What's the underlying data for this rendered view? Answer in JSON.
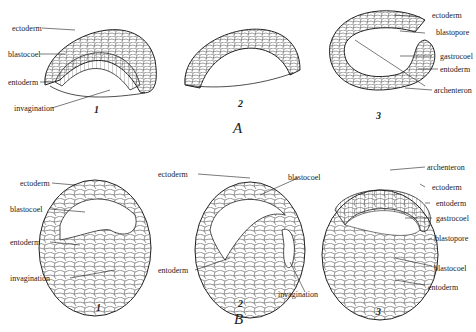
{
  "figure": {
    "groups": [
      {
        "letter": "A",
        "panels": [
          {
            "number": "1",
            "labels": [
              "ectoderm",
              "blastocoel",
              "entoderm",
              "invagination"
            ]
          },
          {
            "number": "2",
            "labels": []
          },
          {
            "number": "3",
            "labels": [
              "ectoderm",
              "blastopore",
              "gastrocoel",
              "entoderm",
              "archenteron"
            ]
          }
        ]
      },
      {
        "letter": "B",
        "panels": [
          {
            "number": "1",
            "labels": [
              "ectoderm",
              "blastocoel",
              "entoderm",
              "invagination"
            ]
          },
          {
            "number": "2",
            "labels": [
              "ectoderm",
              "blastocoel",
              "entoderm",
              "invagination"
            ]
          },
          {
            "number": "3",
            "labels": [
              "archenteron",
              "ectoderm",
              "entoderm",
              "gastrocoel",
              "blastopore",
              "blastocoel",
              "entoderm"
            ]
          }
        ]
      }
    ]
  }
}
